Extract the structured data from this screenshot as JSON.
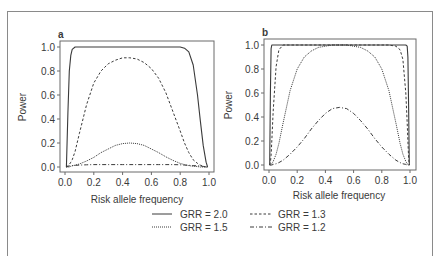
{
  "figure": {
    "legend": [
      {
        "label": "GRR = 2.0",
        "style": "solid"
      },
      {
        "label": "GRR = 1.3",
        "style": "dashed"
      },
      {
        "label": "GRR = 1.5",
        "style": "dotted"
      },
      {
        "label": "GRR = 1.2",
        "style": "dashdot"
      }
    ],
    "line_color": "#3a3a3a",
    "axis_color": "#6a6a6a"
  },
  "chart_data": [
    {
      "type": "line",
      "panel": "a",
      "title": "a",
      "xlabel": "Risk allele frequency",
      "ylabel": "Power",
      "xlim": [
        0.0,
        1.0
      ],
      "ylim": [
        0.0,
        1.0
      ],
      "xticks": [
        "0.0",
        "0.2",
        "0.4",
        "0.6",
        "0.8",
        "1.0"
      ],
      "yticks": [
        "0.0",
        "0.2",
        "0.4",
        "0.6",
        "0.8",
        "1.0"
      ],
      "grid": false,
      "x": [
        0.01,
        0.02,
        0.03,
        0.04,
        0.05,
        0.07,
        0.1,
        0.15,
        0.2,
        0.25,
        0.3,
        0.35,
        0.4,
        0.45,
        0.5,
        0.55,
        0.6,
        0.65,
        0.7,
        0.75,
        0.8,
        0.83,
        0.86,
        0.89,
        0.92,
        0.94,
        0.96,
        0.98,
        0.99
      ],
      "series": [
        {
          "name": "GRR = 2.0",
          "style": "solid",
          "values": [
            0.0,
            0.45,
            0.8,
            0.93,
            0.98,
            1.0,
            1.0,
            1.0,
            1.0,
            1.0,
            1.0,
            1.0,
            1.0,
            1.0,
            1.0,
            1.0,
            1.0,
            1.0,
            1.0,
            1.0,
            1.0,
            0.99,
            0.96,
            0.85,
            0.6,
            0.38,
            0.18,
            0.04,
            0.0
          ]
        },
        {
          "name": "GRR = 1.3",
          "style": "dashed",
          "values": [
            0.0,
            0.01,
            0.02,
            0.04,
            0.06,
            0.13,
            0.28,
            0.52,
            0.7,
            0.8,
            0.86,
            0.89,
            0.91,
            0.91,
            0.9,
            0.87,
            0.82,
            0.74,
            0.62,
            0.46,
            0.3,
            0.2,
            0.12,
            0.06,
            0.03,
            0.015,
            0.006,
            0.0,
            0.0
          ]
        },
        {
          "name": "GRR = 1.5",
          "style": "dotted",
          "values": [
            0.0,
            0.0,
            0.0,
            0.005,
            0.01,
            0.015,
            0.025,
            0.05,
            0.08,
            0.12,
            0.15,
            0.18,
            0.195,
            0.2,
            0.195,
            0.18,
            0.15,
            0.12,
            0.085,
            0.055,
            0.03,
            0.02,
            0.012,
            0.006,
            0.003,
            0.0,
            0.0,
            0.0,
            0.0
          ]
        },
        {
          "name": "GRR = 1.2",
          "style": "dashdot",
          "values": [
            0.0,
            0.005,
            0.008,
            0.01,
            0.012,
            0.014,
            0.016,
            0.018,
            0.02,
            0.02,
            0.02,
            0.02,
            0.02,
            0.02,
            0.02,
            0.02,
            0.02,
            0.02,
            0.02,
            0.02,
            0.018,
            0.016,
            0.014,
            0.012,
            0.01,
            0.008,
            0.005,
            0.002,
            0.0
          ]
        }
      ]
    },
    {
      "type": "line",
      "panel": "b",
      "title": "b",
      "xlabel": "Risk allele frequency",
      "ylabel": "Power",
      "xlim": [
        0.0,
        1.0
      ],
      "ylim": [
        0.0,
        1.0
      ],
      "xticks": [
        "0.0",
        "0.2",
        "0.4",
        "0.6",
        "0.8",
        "1.0"
      ],
      "yticks": [
        "0.0",
        "0.2",
        "0.4",
        "0.6",
        "0.8",
        "1.0"
      ],
      "grid": false,
      "x": [
        0.005,
        0.01,
        0.015,
        0.02,
        0.03,
        0.05,
        0.07,
        0.1,
        0.15,
        0.2,
        0.25,
        0.3,
        0.35,
        0.4,
        0.45,
        0.5,
        0.55,
        0.6,
        0.65,
        0.7,
        0.75,
        0.8,
        0.85,
        0.9,
        0.93,
        0.95,
        0.97,
        0.98,
        0.985,
        0.99,
        0.995
      ],
      "series": [
        {
          "name": "GRR = 2.0",
          "style": "solid",
          "values": [
            0.0,
            0.6,
            0.97,
            1.0,
            1.0,
            1.0,
            1.0,
            1.0,
            1.0,
            1.0,
            1.0,
            1.0,
            1.0,
            1.0,
            1.0,
            1.0,
            1.0,
            1.0,
            1.0,
            1.0,
            1.0,
            1.0,
            1.0,
            1.0,
            1.0,
            1.0,
            1.0,
            0.99,
            0.9,
            0.5,
            0.0
          ]
        },
        {
          "name": "GRR = 1.3",
          "style": "dashed",
          "values": [
            0.0,
            0.02,
            0.08,
            0.2,
            0.45,
            0.82,
            0.96,
            1.0,
            1.0,
            1.0,
            1.0,
            1.0,
            1.0,
            1.0,
            1.0,
            1.0,
            1.0,
            1.0,
            1.0,
            1.0,
            1.0,
            1.0,
            1.0,
            0.99,
            0.96,
            0.88,
            0.6,
            0.35,
            0.2,
            0.06,
            0.0
          ]
        },
        {
          "name": "GRR = 1.5",
          "style": "dotted",
          "values": [
            0.0,
            0.0,
            0.005,
            0.01,
            0.03,
            0.09,
            0.18,
            0.35,
            0.62,
            0.8,
            0.9,
            0.95,
            0.98,
            0.99,
            1.0,
            1.0,
            1.0,
            0.99,
            0.98,
            0.95,
            0.9,
            0.8,
            0.62,
            0.35,
            0.18,
            0.09,
            0.03,
            0.01,
            0.005,
            0.0,
            0.0
          ]
        },
        {
          "name": "GRR = 1.2",
          "style": "dashdot",
          "values": [
            0.0,
            0.0,
            0.0,
            0.0,
            0.005,
            0.01,
            0.02,
            0.04,
            0.09,
            0.15,
            0.22,
            0.3,
            0.37,
            0.43,
            0.47,
            0.48,
            0.47,
            0.43,
            0.37,
            0.3,
            0.22,
            0.15,
            0.09,
            0.04,
            0.02,
            0.01,
            0.005,
            0.0,
            0.0,
            0.0,
            0.0
          ]
        }
      ]
    }
  ]
}
